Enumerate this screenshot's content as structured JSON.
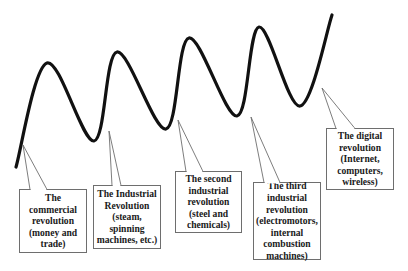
{
  "diagram": {
    "type": "wave-with-callouts",
    "wave": {
      "color": "#111111",
      "stroke_width": 3.2,
      "points": [
        {
          "x": 16,
          "y": 167,
          "kind": "start"
        },
        {
          "x": 47,
          "y": 63,
          "kind": "peak"
        },
        {
          "x": 94,
          "y": 141,
          "kind": "trough"
        },
        {
          "x": 117,
          "y": 52,
          "kind": "peak"
        },
        {
          "x": 166,
          "y": 129,
          "kind": "trough"
        },
        {
          "x": 189,
          "y": 38,
          "kind": "peak"
        },
        {
          "x": 237,
          "y": 116,
          "kind": "trough"
        },
        {
          "x": 259,
          "y": 27,
          "kind": "peak"
        },
        {
          "x": 300,
          "y": 106,
          "kind": "trough"
        },
        {
          "x": 332,
          "y": 15,
          "kind": "end"
        }
      ]
    },
    "callouts": [
      {
        "id": "commercial",
        "lines": [
          "The",
          "commercial",
          "revolution",
          "(money and",
          "trade)"
        ],
        "box": {
          "left": 19,
          "top": 189,
          "width": 68,
          "height": 64
        },
        "pointer": {
          "tip": [
            23,
            145
          ],
          "base": [
            [
              30,
              189
            ],
            [
              47,
              189
            ]
          ]
        }
      },
      {
        "id": "industrial",
        "lines": [
          "The Industrial",
          "Revolution",
          "(steam,",
          "spinning",
          "machines, etc.)"
        ],
        "box": {
          "left": 93,
          "top": 185,
          "width": 68,
          "height": 64
        },
        "pointer": {
          "tip": [
            109,
            131
          ],
          "base": [
            [
              112,
              185
            ],
            [
              121,
              185
            ]
          ]
        }
      },
      {
        "id": "second-industrial",
        "lines": [
          "The second",
          "industrial",
          "revolution",
          "(steel and",
          "chemicals)"
        ],
        "box": {
          "left": 175,
          "top": 171,
          "width": 67,
          "height": 62
        },
        "pointer": {
          "tip": [
            178,
            120
          ],
          "base": [
            [
              186,
              171
            ],
            [
              203,
              171
            ]
          ]
        }
      },
      {
        "id": "third-industrial",
        "lines": [
          "The third",
          "industrial",
          "revolution",
          "(electromotors,",
          "internal",
          "combustion",
          "machines)"
        ],
        "box": {
          "left": 253,
          "top": 182,
          "width": 68,
          "height": 78
        },
        "pointer": {
          "tip": [
            251,
            117
          ],
          "base": [
            [
              264,
              182
            ],
            [
              280,
              182
            ]
          ]
        }
      },
      {
        "id": "digital",
        "lines": [
          "The digital",
          "revolution",
          "(Internet,",
          "computers,",
          "wireless)"
        ],
        "box": {
          "left": 326,
          "top": 128,
          "width": 68,
          "height": 62
        },
        "pointer": {
          "tip": [
            322,
            88
          ],
          "base": [
            [
              336,
              128
            ],
            [
              355,
              128
            ]
          ]
        }
      }
    ],
    "colors": {
      "background": "#ffffff",
      "wave": "#111111",
      "callout_border": "#6e6e6e",
      "callout_text": "#1a1a1a"
    }
  }
}
